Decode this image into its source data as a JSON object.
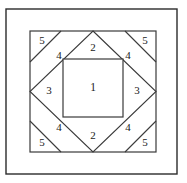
{
  "figure": {
    "kind": "quilt-block-piecing-diagram",
    "canvas": {
      "width": 187,
      "height": 183
    },
    "background_color": "#ffffff",
    "line_color": "#3a3a3a",
    "frame_color": "#2b2b2b",
    "label_color": "#1a1a1a"
  },
  "geometry": {
    "outer_frame": {
      "x": 6,
      "y": 9,
      "width": 171,
      "height": 165
    },
    "block_square": {
      "x": 30,
      "y": 31,
      "width": 126,
      "height": 121
    },
    "diamond_points": "93,31 156,91.5 93,152 30,91.5",
    "center_square": {
      "x": 63,
      "y": 59,
      "width": 60,
      "height": 58
    },
    "corner_cuts": [
      {
        "name": "top-left",
        "x1": 30,
        "y1": 62,
        "x2": 61,
        "y2": 31
      },
      {
        "name": "top-right",
        "x1": 125,
        "y1": 31,
        "x2": 156,
        "y2": 62
      },
      {
        "name": "bottom-right",
        "x1": 156,
        "y1": 121,
        "x2": 125,
        "y2": 152
      },
      {
        "name": "bottom-left",
        "x1": 61,
        "y1": 152,
        "x2": 30,
        "y2": 121
      }
    ]
  },
  "labels": [
    {
      "id": "piece-1-center",
      "text": "1",
      "x": 93,
      "y": 88.5
    },
    {
      "id": "piece-2-top",
      "text": "2",
      "x": 93,
      "y": 48
    },
    {
      "id": "piece-2-bottom",
      "text": "2",
      "x": 93,
      "y": 136
    },
    {
      "id": "piece-3-left",
      "text": "3",
      "x": 49,
      "y": 91.5
    },
    {
      "id": "piece-3-right",
      "text": "3",
      "x": 137,
      "y": 91.5
    },
    {
      "id": "piece-4-top-left",
      "text": "4",
      "x": 59,
      "y": 56
    },
    {
      "id": "piece-4-top-right",
      "text": "4",
      "x": 128,
      "y": 56
    },
    {
      "id": "piece-4-bottom-left",
      "text": "4",
      "x": 59,
      "y": 128
    },
    {
      "id": "piece-4-bottom-right",
      "text": "4",
      "x": 128,
      "y": 128
    },
    {
      "id": "piece-5-top-left",
      "text": "5",
      "x": 42,
      "y": 41
    },
    {
      "id": "piece-5-top-right",
      "text": "5",
      "x": 145,
      "y": 41
    },
    {
      "id": "piece-5-bottom-left",
      "text": "5",
      "x": 42,
      "y": 143
    },
    {
      "id": "piece-5-bottom-right",
      "text": "5",
      "x": 145,
      "y": 143
    }
  ]
}
